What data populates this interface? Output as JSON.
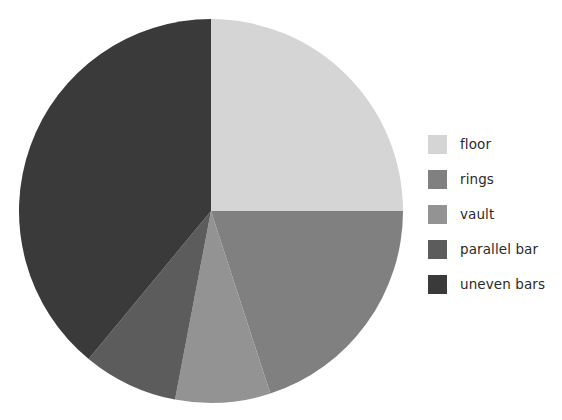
{
  "chart_data": {
    "type": "pie",
    "title": "",
    "categories": [
      "floor",
      "rings",
      "vault",
      "parallel bar",
      "uneven bars"
    ],
    "values": [
      25,
      20,
      8,
      8,
      39
    ],
    "units": "percent",
    "start_angle_deg": 0,
    "direction": "clockwise",
    "colors": [
      "#d5d5d5",
      "#808080",
      "#939393",
      "#5c5c5c",
      "#3a3a3a"
    ],
    "legend": {
      "position": "right",
      "entries": [
        {
          "label": "floor",
          "color": "#d5d5d5",
          "value": 25
        },
        {
          "label": "rings",
          "color": "#808080",
          "value": 20
        },
        {
          "label": "vault",
          "color": "#939393",
          "value": 8
        },
        {
          "label": "parallel bar",
          "color": "#5c5c5c",
          "value": 8
        },
        {
          "label": "uneven bars",
          "color": "#3a3a3a",
          "value": 39
        }
      ]
    },
    "geometry": {
      "cx": 211,
      "cy": 211,
      "r": 192
    },
    "xlabel": "",
    "ylabel": "",
    "grid": false
  }
}
